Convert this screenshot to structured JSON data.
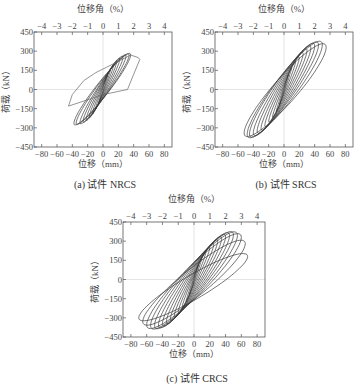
{
  "chart_data": [
    {
      "type": "line",
      "id": "a",
      "caption": "(a) 试件 NRCS",
      "xlabel": "位移（mm）",
      "ylabel": "荷载（kN）",
      "top_xlabel": "位移角（%）",
      "xlim": [
        -90,
        90
      ],
      "ylim": [
        -450,
        450
      ],
      "xticks": [
        -80,
        -60,
        -40,
        -20,
        0,
        20,
        40,
        60,
        80
      ],
      "yticks": [
        -450,
        -300,
        -150,
        0,
        150,
        300,
        450
      ],
      "top_xticks": [
        -4,
        -3,
        -2,
        -1,
        0,
        1,
        2,
        3,
        4
      ],
      "grid": "zero-lines only",
      "peak_load_pos_kN": 270,
      "peak_load_neg_kN": -265,
      "max_disp_pos_mm": 48,
      "max_disp_neg_mm": -45,
      "loops": [
        {
          "dp": 6,
          "dn": -6,
          "fp": 110,
          "fn": -110,
          "w": 0.15
        },
        {
          "dp": 10,
          "dn": -10,
          "fp": 160,
          "fn": -155,
          "w": 0.2
        },
        {
          "dp": 14,
          "dn": -14,
          "fp": 195,
          "fn": -190,
          "w": 0.25
        },
        {
          "dp": 18,
          "dn": -18,
          "fp": 220,
          "fn": -215,
          "w": 0.3
        },
        {
          "dp": 22,
          "dn": -22,
          "fp": 240,
          "fn": -235,
          "w": 0.34
        },
        {
          "dp": 26,
          "dn": -26,
          "fp": 252,
          "fn": -248,
          "w": 0.38
        },
        {
          "dp": 30,
          "dn": -30,
          "fp": 262,
          "fn": -258,
          "w": 0.4
        },
        {
          "dp": 34,
          "dn": -35,
          "fp": 268,
          "fn": -262,
          "w": 0.42
        },
        {
          "dp": 36,
          "dn": -38,
          "fp": 270,
          "fn": -265,
          "w": 0.44
        }
      ],
      "final_branch": [
        [
          36,
          270
        ],
        [
          46,
          250
        ],
        [
          48,
          235
        ],
        [
          40,
          120
        ],
        [
          32,
          0
        ],
        [
          0,
          -40
        ],
        [
          -30,
          -100
        ],
        [
          -45,
          -130
        ],
        [
          -40,
          -40
        ],
        [
          -25,
          70
        ],
        [
          -10,
          130
        ],
        [
          5,
          175
        ],
        [
          20,
          220
        ],
        [
          36,
          270
        ]
      ]
    },
    {
      "type": "line",
      "id": "b",
      "caption": "(b) 试件 SRCS",
      "xlabel": "位移（mm）",
      "ylabel": "荷载（kN）",
      "top_xlabel": "位移角（%）",
      "xlim": [
        -90,
        90
      ],
      "ylim": [
        -450,
        450
      ],
      "xticks": [
        -80,
        -60,
        -40,
        -20,
        0,
        20,
        40,
        60,
        80
      ],
      "yticks": [
        -450,
        -300,
        -150,
        0,
        150,
        300,
        450
      ],
      "top_xticks": [
        -4,
        -3,
        -2,
        -1,
        0,
        1,
        2,
        3,
        4
      ],
      "grid": "zero-lines only",
      "peak_load_pos_kN": 350,
      "peak_load_neg_kN": -350,
      "max_disp_pos_mm": 55,
      "max_disp_neg_mm": -55,
      "loops": [
        {
          "dp": 6,
          "dn": -6,
          "fp": 120,
          "fn": -120,
          "w": 0.12
        },
        {
          "dp": 10,
          "dn": -10,
          "fp": 170,
          "fn": -170,
          "w": 0.18
        },
        {
          "dp": 15,
          "dn": -15,
          "fp": 215,
          "fn": -215,
          "w": 0.25
        },
        {
          "dp": 20,
          "dn": -20,
          "fp": 250,
          "fn": -250,
          "w": 0.32
        },
        {
          "dp": 25,
          "dn": -25,
          "fp": 280,
          "fn": -280,
          "w": 0.38
        },
        {
          "dp": 30,
          "dn": -30,
          "fp": 305,
          "fn": -305,
          "w": 0.43
        },
        {
          "dp": 35,
          "dn": -35,
          "fp": 325,
          "fn": -325,
          "w": 0.48
        },
        {
          "dp": 40,
          "dn": -40,
          "fp": 340,
          "fn": -340,
          "w": 0.52
        },
        {
          "dp": 45,
          "dn": -45,
          "fp": 348,
          "fn": -348,
          "w": 0.55
        },
        {
          "dp": 50,
          "dn": -48,
          "fp": 350,
          "fn": -350,
          "w": 0.58
        },
        {
          "dp": 55,
          "dn": -52,
          "fp": 330,
          "fn": -340,
          "w": 0.6
        }
      ]
    },
    {
      "type": "line",
      "id": "c",
      "caption": "(c) 试件 CRCS",
      "xlabel": "位移（mm）",
      "ylabel": "荷载（kN）",
      "top_xlabel": "位移角（%）",
      "xlim": [
        -90,
        90
      ],
      "ylim": [
        -450,
        450
      ],
      "xticks": [
        -80,
        -60,
        -40,
        -20,
        0,
        20,
        40,
        60,
        80
      ],
      "yticks": [
        -450,
        -300,
        -150,
        0,
        150,
        300,
        450
      ],
      "top_xticks": [
        -4,
        -3,
        -2,
        -1,
        0,
        1,
        2,
        3,
        4
      ],
      "grid": "zero-lines only",
      "peak_load_pos_kN": 350,
      "peak_load_neg_kN": -360,
      "max_disp_pos_mm": 68,
      "max_disp_neg_mm": -70,
      "loops": [
        {
          "dp": 6,
          "dn": -6,
          "fp": 120,
          "fn": -120,
          "w": 0.12
        },
        {
          "dp": 10,
          "dn": -10,
          "fp": 170,
          "fn": -170,
          "w": 0.18
        },
        {
          "dp": 15,
          "dn": -15,
          "fp": 215,
          "fn": -215,
          "w": 0.24
        },
        {
          "dp": 20,
          "dn": -20,
          "fp": 250,
          "fn": -255,
          "w": 0.3
        },
        {
          "dp": 25,
          "dn": -25,
          "fp": 275,
          "fn": -285,
          "w": 0.35
        },
        {
          "dp": 30,
          "dn": -30,
          "fp": 300,
          "fn": -310,
          "w": 0.4
        },
        {
          "dp": 35,
          "dn": -35,
          "fp": 320,
          "fn": -330,
          "w": 0.44
        },
        {
          "dp": 40,
          "dn": -40,
          "fp": 335,
          "fn": -345,
          "w": 0.48
        },
        {
          "dp": 45,
          "dn": -45,
          "fp": 345,
          "fn": -355,
          "w": 0.52
        },
        {
          "dp": 50,
          "dn": -50,
          "fp": 350,
          "fn": -360,
          "w": 0.55
        },
        {
          "dp": 55,
          "dn": -55,
          "fp": 345,
          "fn": -360,
          "w": 0.58
        },
        {
          "dp": 60,
          "dn": -60,
          "fp": 330,
          "fn": -355,
          "w": 0.6
        },
        {
          "dp": 65,
          "dn": -65,
          "fp": 280,
          "fn": -330,
          "w": 0.62
        },
        {
          "dp": 68,
          "dn": -70,
          "fp": 180,
          "fn": -300,
          "w": 0.64
        }
      ]
    }
  ],
  "panels": [
    {
      "caption": "(a) 试件 NRCS"
    },
    {
      "caption": "(b) 试件 SRCS"
    },
    {
      "caption": "(c) 试件 CRCS"
    }
  ],
  "colors": {
    "curve": "#3a3a3a",
    "axis": "#555555",
    "zero_line": "#dddddd"
  }
}
